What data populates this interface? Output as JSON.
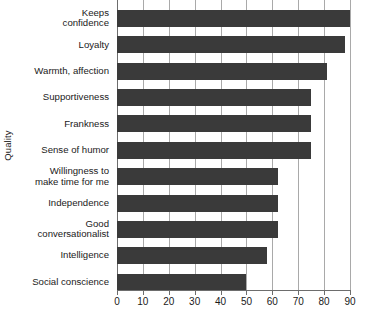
{
  "chart_data": {
    "type": "bar",
    "orientation": "horizontal",
    "title": "",
    "xlabel": "",
    "ylabel": "Quality",
    "xlim": [
      0,
      90
    ],
    "xticks": [
      0,
      10,
      20,
      30,
      40,
      50,
      60,
      70,
      80,
      90
    ],
    "grid": "vertical",
    "legend": "none",
    "bar_color": "#3a3a3a",
    "gridline_color": "#a9a9a9",
    "axis_color": "#6d6d6d",
    "categories": [
      "Keeps confidence",
      "Loyalty",
      "Warmth, affection",
      "Supportiveness",
      "Frankness",
      "Sense of humor",
      "Willingness to make time for me",
      "Independence",
      "Good conversationalist",
      "Intelligence",
      "Social conscience"
    ],
    "category_lines": [
      [
        "Keeps",
        "confidence"
      ],
      [
        "Loyalty"
      ],
      [
        "Warmth, affection"
      ],
      [
        "Supportiveness"
      ],
      [
        "Frankness"
      ],
      [
        "Sense of humor"
      ],
      [
        "Willingness to",
        "make time for me"
      ],
      [
        "Independence"
      ],
      [
        "Good",
        "conversationalist"
      ],
      [
        "Intelligence"
      ],
      [
        "Social conscience"
      ]
    ],
    "values": [
      90,
      88,
      81,
      75,
      75,
      75,
      62,
      62,
      62,
      58,
      50
    ]
  }
}
